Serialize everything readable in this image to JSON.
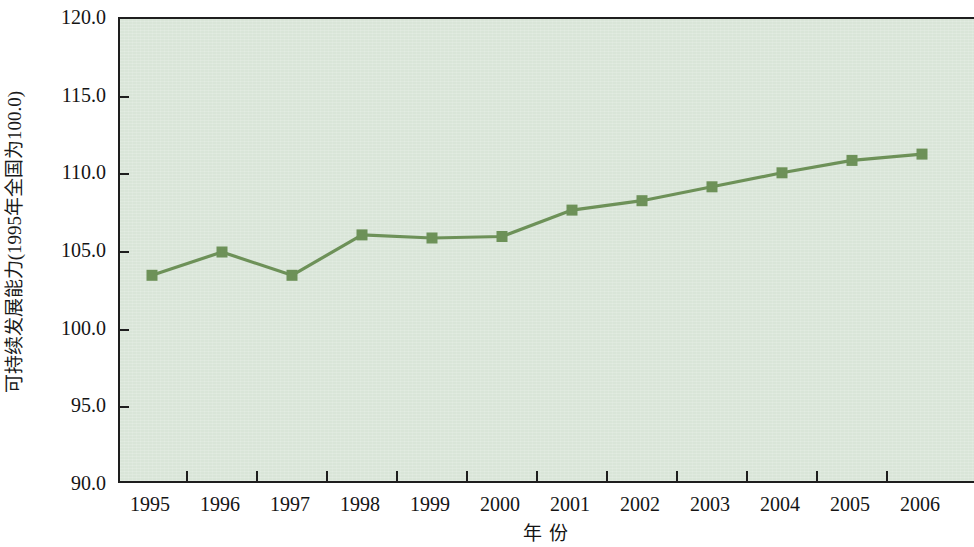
{
  "chart_data": {
    "type": "line",
    "title": "",
    "subtitle": "",
    "xlabel": "年 份",
    "ylabel": "可持续发展能力(1995年全国为100.0)",
    "categories": [
      "1995",
      "1996",
      "1997",
      "1998",
      "1999",
      "2000",
      "2001",
      "2002",
      "2003",
      "2004",
      "2005",
      "2006"
    ],
    "values": [
      103.5,
      105.0,
      103.5,
      106.1,
      105.9,
      106.0,
      107.7,
      108.3,
      109.2,
      110.1,
      110.9,
      111.3
    ],
    "series": [
      {
        "name": "可持续发展能力",
        "values": [
          103.5,
          105.0,
          103.5,
          106.1,
          105.9,
          106.0,
          107.7,
          108.3,
          109.2,
          110.1,
          110.9,
          111.3
        ]
      }
    ],
    "ylim": [
      90.0,
      120.0
    ],
    "y_ticks": [
      90.0,
      95.0,
      100.0,
      105.0,
      110.0,
      115.0,
      120.0
    ],
    "y_tick_labels": [
      "90.0",
      "95.0",
      "100.0",
      "105.0",
      "110.0",
      "115.0",
      "120.0"
    ],
    "x_tick_labels": [
      "1995",
      "1996",
      "1997",
      "1998",
      "1999",
      "2000",
      "2001",
      "2002",
      "2003",
      "2004",
      "2005",
      "2006"
    ],
    "grid": false,
    "legend": null,
    "legend_position": "none",
    "marker": "square",
    "colors": {
      "line": "#6d9158",
      "marker": "#6d9158",
      "plot_background": "#d9e5d8",
      "axis": "#1e1e1e",
      "text": "#141414",
      "figure_background": "#ffffff"
    }
  }
}
